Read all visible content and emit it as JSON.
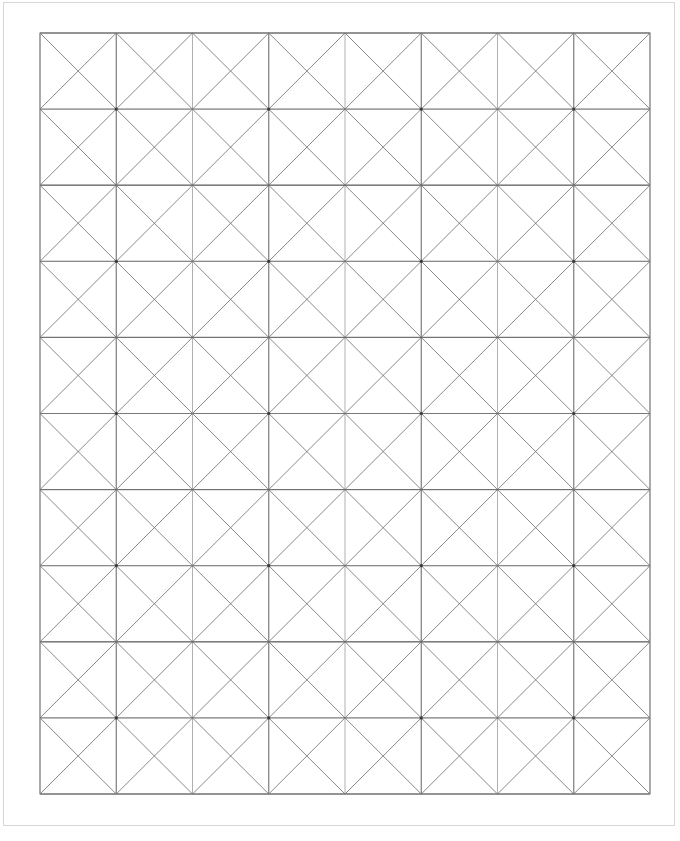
{
  "page": {
    "background_color": "#ffffff",
    "width": 680,
    "height": 841
  },
  "page_border": {
    "name": "outer-page-border",
    "x": 3.5,
    "y": 2.5,
    "width": 671,
    "height": 823,
    "stroke": "#d7d7d7",
    "stroke_width": 1
  },
  "frame": {
    "name": "pattern-frame",
    "x": 40,
    "y": 33,
    "width": 610,
    "height": 761,
    "stroke": "#7d7d7d",
    "stroke_width": 1,
    "fill": "none"
  },
  "grid": {
    "name": "background-grid",
    "columns": 8,
    "rows": 10,
    "cell_width": 76.25,
    "cell_height": 76.1,
    "vertical_x": [
      40,
      116.25,
      192.5,
      268.75,
      345,
      421.25,
      497.5,
      573.75,
      650
    ],
    "horizontal_y": [
      33,
      109.1,
      185.2,
      261.3,
      337.4,
      413.5,
      489.6,
      565.7,
      641.8,
      717.9,
      794
    ],
    "stroke": "#8f8f8f",
    "stroke_width": 0.7
  },
  "motif": {
    "name": "eight-point-star-pinwheel",
    "description": "Star with eight spokes from the cell center to the eight surrounding grid nodes, overlaid with a tilted square linking the four edge midpoints of the 2x2 block",
    "centers_x": [
      116.25,
      268.75,
      421.25,
      573.75
    ],
    "centers_y": [
      109.1,
      261.3,
      413.5,
      565.7,
      717.9
    ],
    "block_half_width": 76.25,
    "block_half_height": 76.1,
    "spoke_stroke": "#6b6b6b",
    "spoke_stroke_width": 0.8,
    "square_stroke": "#6b6b6b",
    "square_stroke_width": 0.8,
    "node_color": "#3a3a3a",
    "node_radius": 1.6
  },
  "chart_data": {
    "type": "diagram",
    "unit_cell": {
      "width": 152.5,
      "height": 152.2,
      "motif_count_x": 4,
      "motif_count_y": 5,
      "total_motifs": 20
    },
    "legend": [],
    "annotations": []
  }
}
